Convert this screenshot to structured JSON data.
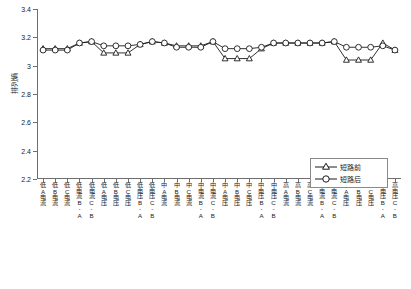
{
  "chart_data": {
    "type": "line",
    "title": "",
    "xlabel": "",
    "ylabel": "排列熵",
    "ylim": [
      2.2,
      3.4
    ],
    "yticks": [
      2.2,
      2.4,
      2.6,
      2.8,
      3.0,
      3.2,
      3.4
    ],
    "ytick_labels": [
      "2.2",
      "2.4",
      "2.6",
      "2.8",
      "3",
      "3.2",
      "3.4"
    ],
    "grid": false,
    "legend_position": "lower-right",
    "categories": [
      "低A电流",
      "低B电流",
      "低C电流",
      "低电流B-A",
      "低电流C-B",
      "低A电压",
      "低B电压",
      "低C电压",
      "低电压B-A",
      "低电压C-B",
      "中A电流",
      "中B电流",
      "中C电流",
      "中电流B-A",
      "中电流C-B",
      "中A电压",
      "中B电压",
      "中C电压",
      "中电压B-A",
      "中电压C-B",
      "高A电流",
      "高B电流",
      "高C电流",
      "高电流B-A",
      "高电流C-B",
      "高A电压",
      "高B电压",
      "高C电压",
      "高电压B-A",
      "高电压C-B"
    ],
    "series": [
      {
        "name": "短路前",
        "marker": "triangle",
        "values": [
          3.12,
          3.12,
          3.12,
          3.16,
          3.17,
          3.09,
          3.09,
          3.09,
          3.15,
          3.17,
          3.16,
          3.14,
          3.14,
          3.14,
          3.17,
          3.05,
          3.05,
          3.05,
          3.12,
          3.16,
          3.16,
          3.16,
          3.16,
          3.16,
          3.17,
          3.04,
          3.04,
          3.04,
          3.16,
          3.11
        ]
      },
      {
        "name": "短路后",
        "marker": "circle",
        "values": [
          3.11,
          3.11,
          3.11,
          3.16,
          3.17,
          3.14,
          3.14,
          3.14,
          3.15,
          3.17,
          3.16,
          3.13,
          3.13,
          3.13,
          3.17,
          3.12,
          3.12,
          3.12,
          3.13,
          3.16,
          3.16,
          3.16,
          3.16,
          3.16,
          3.17,
          3.13,
          3.13,
          3.13,
          3.14,
          3.11
        ]
      }
    ]
  },
  "legend": {
    "items": [
      {
        "label": "短路前",
        "marker": "triangle"
      },
      {
        "label": "短路后",
        "marker": "circle"
      }
    ]
  }
}
